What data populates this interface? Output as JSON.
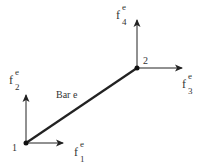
{
  "diagram": {
    "bar_label": "Bar e",
    "nodes": [
      {
        "id": "1",
        "label": "1"
      },
      {
        "id": "2",
        "label": "2"
      }
    ],
    "forces": [
      {
        "base": "f",
        "sub": "1",
        "sup": "e",
        "node": "1",
        "direction": "x"
      },
      {
        "base": "f",
        "sub": "2",
        "sup": "e",
        "node": "1",
        "direction": "y"
      },
      {
        "base": "f",
        "sub": "3",
        "sup": "e",
        "node": "2",
        "direction": "x"
      },
      {
        "base": "f",
        "sub": "4",
        "sup": "e",
        "node": "2",
        "direction": "y"
      }
    ],
    "colors": {
      "line": "#222222",
      "text": "#333333"
    }
  }
}
